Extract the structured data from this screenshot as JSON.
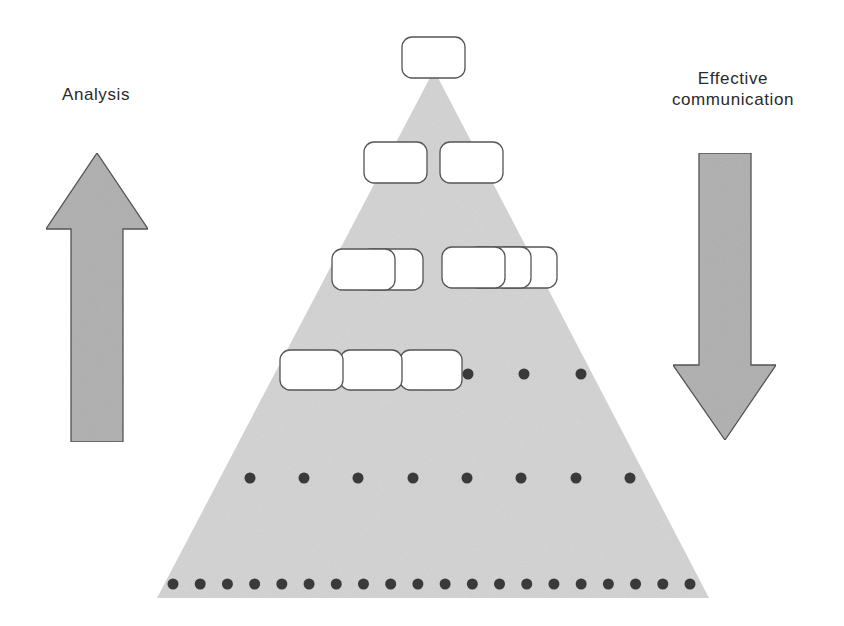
{
  "labels": {
    "left": "Analysis",
    "right_line1": "Effective",
    "right_line2": "communication"
  },
  "colors": {
    "pyramid_fill": "#d5d5d5",
    "arrow_fill": "#b3b3b3",
    "outline": "#555555",
    "box_fill": "#ffffff",
    "dot_fill": "#3a3a3a",
    "text": "#2a2a2a"
  },
  "pyramid": {
    "apex": [
      434,
      70
    ],
    "base_left": [
      157,
      598
    ],
    "base_right": [
      709,
      598
    ]
  },
  "arrows": {
    "up": {
      "direction": "up",
      "label_ref": "labels.left"
    },
    "down": {
      "direction": "down",
      "label_ref": "labels.right"
    }
  },
  "levels": [
    {
      "level": 1,
      "boxes": [
        {
          "x": 402,
          "y": 37
        }
      ],
      "dots": []
    },
    {
      "level": 2,
      "boxes": [
        {
          "x": 364,
          "y": 142
        },
        {
          "x": 440,
          "y": 142
        }
      ],
      "dots": []
    },
    {
      "level": 3,
      "box_groups": [
        {
          "front_x": 332,
          "y": 249,
          "stacked_behind": 1
        },
        {
          "front_x": 442,
          "y": 247,
          "stacked_behind": 2
        }
      ],
      "dots": []
    },
    {
      "level": 4,
      "boxes": [
        {
          "x": 280,
          "y": 350
        },
        {
          "x": 340,
          "y": 350
        },
        {
          "x": 400,
          "y": 350
        }
      ],
      "dots": [
        468,
        524,
        581
      ]
    },
    {
      "level": 5,
      "boxes": [],
      "dots": [
        250,
        304,
        358,
        413,
        467,
        521,
        576,
        630
      ]
    },
    {
      "level": 6,
      "boxes": [],
      "dot_count": 20,
      "dot_first_x": 173,
      "dot_last_x": 690
    }
  ]
}
